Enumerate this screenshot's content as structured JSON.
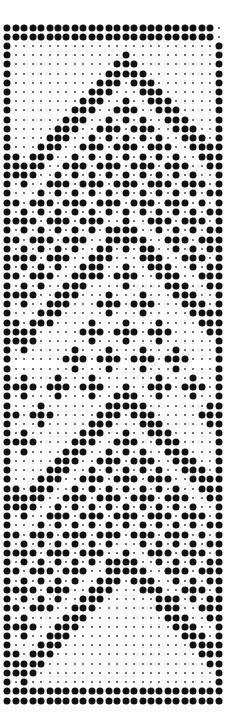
{
  "pattern": {
    "cols": 26,
    "rows_count": 74,
    "origin_x": 7.3,
    "origin_y": 27.5,
    "pitch_x": 8.45,
    "pitch_y": 9.22,
    "on_color": "#111111",
    "off_color": "#444444",
    "background": "#ffffff",
    "rows": [
      [
        0,
        1,
        2,
        3,
        4,
        5,
        6,
        7,
        8,
        9,
        10,
        11,
        12,
        13,
        14,
        15,
        16,
        17,
        18,
        19,
        20,
        21,
        22,
        23,
        24
      ],
      [
        0,
        1,
        2,
        3,
        4,
        5,
        6,
        7,
        8,
        9,
        10,
        11,
        12,
        13,
        14,
        15,
        16,
        17,
        18,
        19,
        20,
        21,
        22,
        23,
        24
      ],
      [
        0,
        25
      ],
      [
        0,
        14,
        25
      ],
      [
        0,
        13,
        14,
        15,
        25
      ],
      [
        0,
        12,
        13,
        14,
        15,
        16,
        25
      ],
      [
        0,
        11,
        12,
        13,
        15,
        16,
        17,
        25
      ],
      [
        0,
        10,
        11,
        12,
        16,
        17,
        18,
        25
      ],
      [
        0,
        9,
        10,
        11,
        14,
        17,
        18,
        19,
        25
      ],
      [
        0,
        8,
        9,
        10,
        13,
        14,
        15,
        18,
        19,
        20,
        25
      ],
      [
        0,
        7,
        8,
        9,
        12,
        14,
        16,
        19,
        20,
        21,
        25
      ],
      [
        0,
        6,
        7,
        8,
        11,
        12,
        13,
        15,
        16,
        17,
        20,
        21,
        22,
        25
      ],
      [
        0,
        5,
        6,
        7,
        10,
        12,
        14,
        16,
        18,
        21,
        22,
        23,
        25
      ],
      [
        0,
        4,
        5,
        6,
        9,
        10,
        11,
        13,
        14,
        15,
        17,
        18,
        19,
        22,
        23,
        24,
        25
      ],
      [
        0,
        1,
        3,
        4,
        5,
        8,
        10,
        12,
        14,
        16,
        18,
        20,
        23,
        24,
        25
      ],
      [
        0,
        1,
        2,
        3,
        4,
        7,
        8,
        9,
        11,
        12,
        13,
        15,
        16,
        17,
        19,
        20,
        21,
        24,
        25
      ],
      [
        0,
        1,
        2,
        3,
        6,
        8,
        10,
        12,
        14,
        16,
        18,
        20,
        22,
        25
      ],
      [
        0,
        2,
        5,
        6,
        7,
        9,
        10,
        11,
        13,
        14,
        15,
        17,
        18,
        19,
        21,
        22,
        23,
        25
      ],
      [
        0,
        4,
        6,
        8,
        10,
        12,
        14,
        16,
        18,
        20,
        22,
        24,
        25
      ],
      [
        0,
        1,
        3,
        4,
        5,
        7,
        8,
        9,
        11,
        12,
        13,
        15,
        16,
        17,
        19,
        20,
        21,
        23,
        25
      ],
      [
        0,
        2,
        4,
        6,
        8,
        10,
        12,
        14,
        16,
        18,
        20,
        22,
        24,
        25
      ],
      [
        0,
        1,
        2,
        3,
        5,
        6,
        7,
        9,
        10,
        11,
        14,
        17,
        18,
        19,
        21,
        22,
        23,
        25
      ],
      [
        0,
        2,
        4,
        6,
        8,
        10,
        12,
        13,
        14,
        15,
        18,
        20,
        22,
        24,
        25
      ],
      [
        0,
        1,
        3,
        4,
        5,
        7,
        8,
        9,
        12,
        13,
        14,
        15,
        16,
        19,
        20,
        21,
        23,
        24,
        25
      ],
      [
        0,
        2,
        4,
        6,
        8,
        11,
        12,
        14,
        16,
        17,
        20,
        22,
        24,
        25
      ],
      [
        0,
        1,
        2,
        3,
        5,
        6,
        7,
        10,
        11,
        12,
        16,
        17,
        18,
        21,
        22,
        23,
        25
      ],
      [
        0,
        2,
        4,
        6,
        9,
        10,
        11,
        14,
        17,
        18,
        19,
        22,
        24,
        25
      ],
      [
        0,
        1,
        3,
        4,
        5,
        8,
        9,
        10,
        11,
        13,
        14,
        15,
        18,
        19,
        20,
        23,
        24,
        25
      ],
      [
        0,
        2,
        4,
        7,
        8,
        9,
        14,
        19,
        20,
        21,
        24,
        25
      ],
      [
        0,
        1,
        2,
        3,
        6,
        7,
        8,
        12,
        16,
        20,
        21,
        22,
        25
      ],
      [
        0,
        2,
        5,
        6,
        7,
        11,
        12,
        13,
        15,
        16,
        17,
        21,
        22,
        23,
        25
      ],
      [
        0,
        4,
        5,
        6,
        12,
        16,
        22,
        23,
        24,
        25
      ],
      [
        0,
        1,
        3,
        4,
        5,
        10,
        14,
        18,
        23,
        24,
        25
      ],
      [
        0,
        1,
        2,
        3,
        9,
        10,
        11,
        13,
        14,
        15,
        17,
        18,
        19,
        24,
        25
      ],
      [
        0,
        1,
        2,
        3,
        10,
        14,
        18,
        25
      ],
      [
        0,
        2,
        8,
        12,
        16,
        20,
        25
      ],
      [
        0,
        7,
        8,
        9,
        11,
        12,
        13,
        15,
        16,
        17,
        19,
        20,
        21,
        25
      ],
      [
        0,
        8,
        12,
        16,
        20,
        25
      ],
      [
        0,
        2,
        6,
        10,
        18,
        22,
        25
      ],
      [
        0,
        1,
        2,
        3,
        5,
        6,
        7,
        9,
        10,
        11,
        14,
        17,
        18,
        19,
        21,
        22,
        23,
        25
      ],
      [
        0,
        2,
        6,
        10,
        13,
        14,
        15,
        18,
        22,
        25
      ],
      [
        0,
        4,
        12,
        13,
        14,
        15,
        16,
        24,
        25
      ],
      [
        0,
        1,
        3,
        4,
        5,
        11,
        12,
        13,
        15,
        16,
        17,
        23,
        24,
        25
      ],
      [
        0,
        4,
        10,
        11,
        12,
        16,
        17,
        18,
        24,
        25
      ],
      [
        0,
        2,
        9,
        10,
        11,
        14,
        17,
        18,
        19,
        25
      ],
      [
        0,
        1,
        2,
        3,
        8,
        9,
        10,
        13,
        14,
        15,
        18,
        19,
        20,
        25
      ],
      [
        0,
        2,
        7,
        8,
        9,
        12,
        14,
        16,
        19,
        20,
        21,
        25
      ],
      [
        0,
        6,
        7,
        8,
        11,
        12,
        13,
        15,
        16,
        17,
        20,
        21,
        22,
        25
      ],
      [
        0,
        5,
        6,
        7,
        10,
        12,
        14,
        16,
        18,
        21,
        22,
        23,
        25
      ],
      [
        0,
        4,
        5,
        6,
        9,
        10,
        11,
        13,
        14,
        15,
        17,
        18,
        19,
        22,
        23,
        24,
        25
      ],
      [
        0,
        1,
        3,
        4,
        5,
        8,
        10,
        12,
        14,
        16,
        18,
        20,
        23,
        24,
        25
      ],
      [
        0,
        1,
        2,
        3,
        4,
        7,
        8,
        9,
        11,
        12,
        13,
        15,
        16,
        17,
        19,
        20,
        21,
        24,
        25
      ],
      [
        0,
        1,
        2,
        3,
        6,
        8,
        10,
        12,
        14,
        16,
        18,
        20,
        22,
        25
      ],
      [
        0,
        2,
        5,
        6,
        7,
        9,
        10,
        11,
        13,
        14,
        15,
        17,
        18,
        19,
        21,
        22,
        23,
        25
      ],
      [
        0,
        4,
        6,
        8,
        10,
        12,
        14,
        16,
        18,
        20,
        22,
        24,
        25
      ],
      [
        0,
        1,
        3,
        4,
        5,
        7,
        8,
        9,
        11,
        12,
        13,
        15,
        16,
        17,
        19,
        20,
        21,
        23,
        25
      ],
      [
        0,
        2,
        4,
        6,
        8,
        10,
        12,
        16,
        18,
        20,
        22,
        24,
        25
      ],
      [
        0,
        1,
        2,
        3,
        5,
        6,
        7,
        9,
        10,
        11,
        14,
        17,
        18,
        19,
        21,
        22,
        23,
        25
      ],
      [
        0,
        2,
        4,
        6,
        8,
        10,
        12,
        13,
        14,
        15,
        18,
        20,
        22,
        24,
        25
      ],
      [
        0,
        1,
        3,
        4,
        5,
        7,
        8,
        9,
        12,
        13,
        14,
        15,
        16,
        19,
        20,
        21,
        23,
        24,
        25
      ],
      [
        0,
        2,
        4,
        6,
        8,
        11,
        12,
        13,
        15,
        16,
        17,
        20,
        22,
        24,
        25
      ],
      [
        0,
        1,
        2,
        3,
        5,
        6,
        7,
        10,
        11,
        12,
        16,
        17,
        18,
        21,
        22,
        23,
        25
      ],
      [
        0,
        2,
        4,
        6,
        9,
        10,
        11,
        18,
        19,
        20,
        22,
        24,
        25
      ],
      [
        0,
        1,
        3,
        4,
        5,
        8,
        9,
        10,
        18,
        19,
        20,
        23,
        24,
        25
      ],
      [
        0,
        2,
        7,
        8,
        9,
        19,
        20,
        21,
        24,
        25
      ],
      [
        0,
        1,
        2,
        3,
        6,
        7,
        8,
        20,
        21,
        22,
        25
      ],
      [
        0,
        2,
        5,
        6,
        7,
        21,
        22,
        23,
        25
      ],
      [
        0,
        4,
        5,
        6,
        22,
        23,
        24,
        25
      ],
      [
        0,
        1,
        3,
        4,
        5,
        23,
        24,
        25
      ],
      [
        0,
        1,
        2,
        3,
        4,
        24,
        25
      ],
      [
        0,
        1,
        2,
        3,
        25
      ],
      [
        0,
        2,
        25
      ],
      [
        0,
        1,
        2,
        3,
        4,
        5,
        6,
        7,
        8,
        9,
        10,
        11,
        12,
        13,
        14,
        15,
        16,
        17,
        18,
        19,
        20,
        21,
        22,
        23,
        24,
        25
      ],
      [
        0,
        1,
        2,
        3,
        4,
        5,
        6,
        7,
        8,
        9,
        10,
        11,
        12,
        13,
        14,
        15,
        16,
        17,
        18,
        19,
        20,
        21,
        22,
        23,
        24,
        25
      ]
    ]
  }
}
